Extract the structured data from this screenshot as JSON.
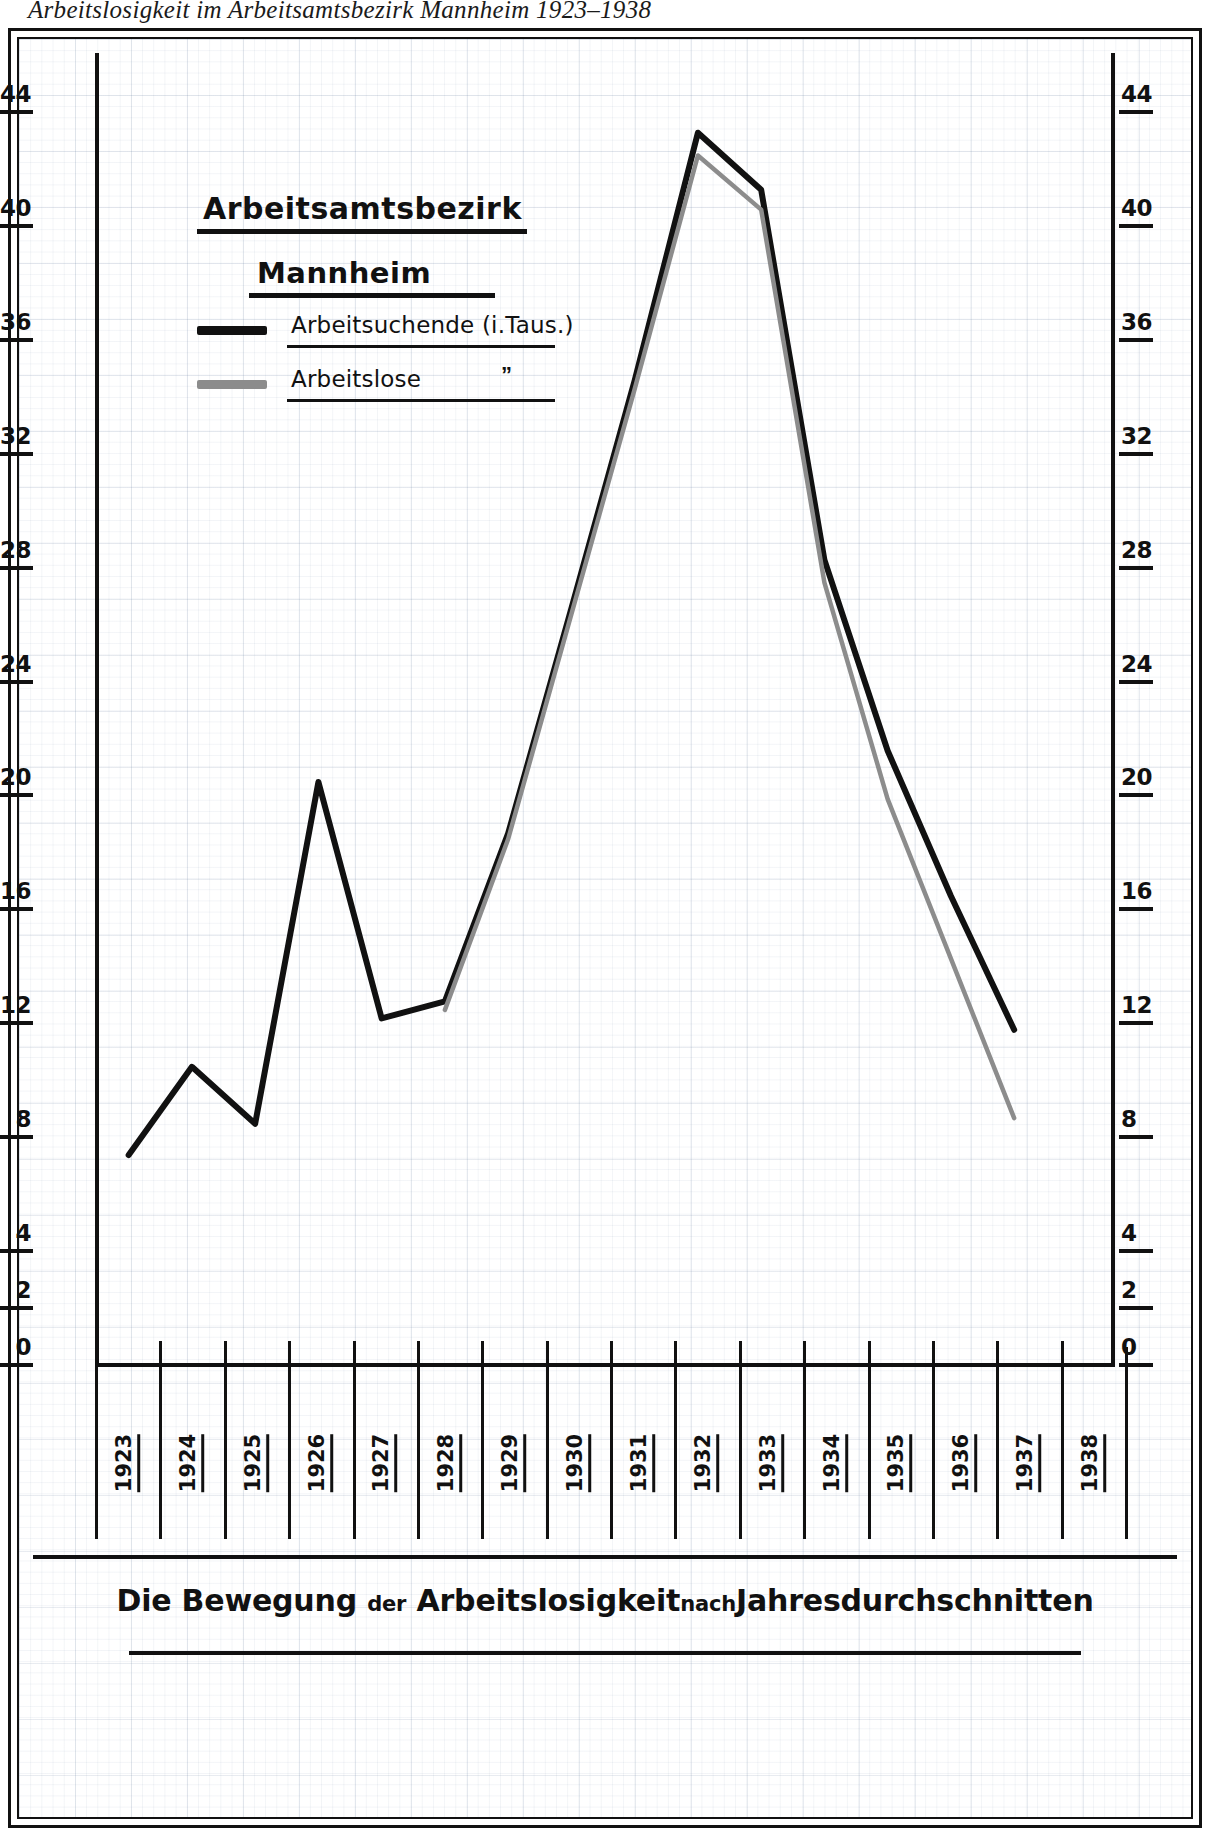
{
  "title": "Arbeitslosigkeit im Arbeitsamtsbezirk Mannheim 1923–1938",
  "legend": {
    "heading1": "Arbeitsamtsbezirk",
    "heading2": "Mannheim",
    "entries": [
      {
        "label": "Arbeitsuchende (i.Taus.)",
        "color": "#111111",
        "ditto": ""
      },
      {
        "label": "Arbeitslose",
        "color": "#8c8c8c",
        "ditto": "”"
      }
    ]
  },
  "caption": {
    "part1": "Die Bewegung",
    "small1": "der",
    "part2": "Arbeitslosigkeit",
    "small2": "nach",
    "part3": "Jahresdurchschnitten"
  },
  "chart_data": {
    "type": "line",
    "title": "Arbeitslosigkeit im Arbeitsamtsbezirk Mannheim 1923–1938",
    "xlabel": "",
    "ylabel": "i. Taus.",
    "grid": true,
    "legend_position": "upper-left",
    "ylim": [
      0,
      46
    ],
    "yticks": [
      0,
      2,
      4,
      8,
      12,
      16,
      20,
      24,
      28,
      32,
      36,
      40,
      44
    ],
    "ytick_labels": [
      "0",
      "2",
      "4",
      "8",
      "12",
      "16",
      "20",
      "24",
      "28",
      "32",
      "36",
      "40",
      "44"
    ],
    "categories": [
      "1923",
      "1924",
      "1925",
      "1926",
      "1927",
      "1928",
      "1929",
      "1930",
      "1931",
      "1932",
      "1933",
      "1934",
      "1935",
      "1936",
      "1937",
      "1938"
    ],
    "series": [
      {
        "name": "Arbeitsuchende (i.Taus.)",
        "color": "#111111",
        "values": [
          7.3,
          10.4,
          8.4,
          20.4,
          12.1,
          12.7,
          18.6,
          26.5,
          34.5,
          43.2,
          41.2,
          28.2,
          21.5,
          16.4,
          11.7,
          null
        ]
      },
      {
        "name": "Arbeitslose",
        "color": "#8c8c8c",
        "values": [
          null,
          null,
          null,
          null,
          null,
          12.4,
          18.4,
          26.3,
          34.2,
          42.4,
          40.5,
          27.4,
          19.8,
          14.2,
          8.6,
          null
        ]
      }
    ]
  }
}
